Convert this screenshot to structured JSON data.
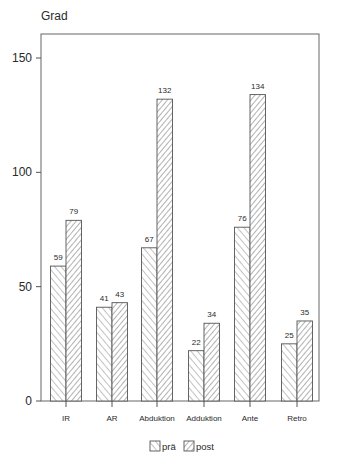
{
  "chart_data": {
    "type": "bar",
    "title": "",
    "xlabel": "",
    "ylabel": "Grad",
    "ylim": [
      0,
      160
    ],
    "yticks": [
      0,
      50,
      100,
      150
    ],
    "grid": false,
    "legend_position": "bottom",
    "categories": [
      "IR",
      "AR",
      "Abduktion",
      "Adduktion",
      "Ante",
      "Retro"
    ],
    "series": [
      {
        "name": "prä",
        "pattern": "hatch-forward",
        "values": [
          59,
          41,
          67,
          22,
          76,
          25
        ]
      },
      {
        "name": "post",
        "pattern": "hatch-backward",
        "values": [
          79,
          43,
          132,
          34,
          134,
          35
        ]
      }
    ],
    "data_labels": true
  },
  "colors": {
    "axis": "#555555",
    "hatch": "#555555",
    "bar_fill": "#ffffff",
    "text": "#2a2a2a"
  }
}
